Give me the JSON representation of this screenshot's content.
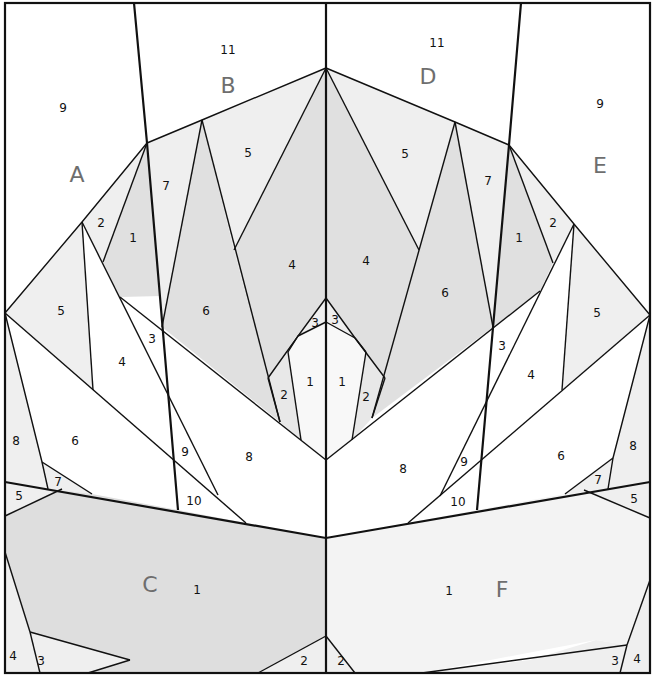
{
  "diagram": {
    "type": "paper-piecing quilt pattern",
    "colors": {
      "background": "#ffffff",
      "light_fill": "#efefef",
      "medium_fill": "#e0e0e0",
      "bottom_left_fill": "#dedede",
      "bottom_right_fill": "#f3f3f3",
      "line": "#111111",
      "section_letter": "#6e6e6e"
    },
    "sections": [
      {
        "letter": "A",
        "x": 77,
        "y": 174
      },
      {
        "letter": "B",
        "x": 228,
        "y": 85
      },
      {
        "letter": "C",
        "x": 150,
        "y": 584
      },
      {
        "letter": "D",
        "x": 428,
        "y": 76
      },
      {
        "letter": "E",
        "x": 600,
        "y": 165
      },
      {
        "letter": "F",
        "x": 502,
        "y": 589
      }
    ],
    "piece_numbers": [
      {
        "n": "9",
        "x": 63,
        "y": 108
      },
      {
        "n": "2",
        "x": 101,
        "y": 223
      },
      {
        "n": "1",
        "x": 133,
        "y": 238
      },
      {
        "n": "5",
        "x": 61,
        "y": 311
      },
      {
        "n": "4",
        "x": 122,
        "y": 362
      },
      {
        "n": "3",
        "x": 152,
        "y": 339
      },
      {
        "n": "8",
        "x": 16,
        "y": 441
      },
      {
        "n": "6",
        "x": 75,
        "y": 441
      },
      {
        "n": "7",
        "x": 58,
        "y": 482
      },
      {
        "n": "5",
        "x": 19,
        "y": 496
      },
      {
        "n": "11",
        "x": 228,
        "y": 50
      },
      {
        "n": "7",
        "x": 166,
        "y": 186
      },
      {
        "n": "5",
        "x": 248,
        "y": 153
      },
      {
        "n": "6",
        "x": 206,
        "y": 311
      },
      {
        "n": "4",
        "x": 292,
        "y": 265
      },
      {
        "n": "3",
        "x": 315,
        "y": 323
      },
      {
        "n": "2",
        "x": 284,
        "y": 395
      },
      {
        "n": "1",
        "x": 310,
        "y": 382
      },
      {
        "n": "9",
        "x": 185,
        "y": 452
      },
      {
        "n": "8",
        "x": 249,
        "y": 457
      },
      {
        "n": "10",
        "x": 194,
        "y": 501
      },
      {
        "n": "1",
        "x": 197,
        "y": 590
      },
      {
        "n": "4",
        "x": 13,
        "y": 656
      },
      {
        "n": "3",
        "x": 41,
        "y": 661
      },
      {
        "n": "2",
        "x": 304,
        "y": 661
      },
      {
        "n": "11",
        "x": 437,
        "y": 43
      },
      {
        "n": "5",
        "x": 405,
        "y": 154
      },
      {
        "n": "7",
        "x": 488,
        "y": 181
      },
      {
        "n": "4",
        "x": 366,
        "y": 261
      },
      {
        "n": "6",
        "x": 445,
        "y": 293
      },
      {
        "n": "3",
        "x": 335,
        "y": 320
      },
      {
        "n": "1",
        "x": 342,
        "y": 382
      },
      {
        "n": "2",
        "x": 366,
        "y": 397
      },
      {
        "n": "8",
        "x": 403,
        "y": 469
      },
      {
        "n": "9",
        "x": 464,
        "y": 462
      },
      {
        "n": "10",
        "x": 458,
        "y": 502
      },
      {
        "n": "9",
        "x": 600,
        "y": 104
      },
      {
        "n": "1",
        "x": 519,
        "y": 238
      },
      {
        "n": "2",
        "x": 553,
        "y": 223
      },
      {
        "n": "5",
        "x": 597,
        "y": 313
      },
      {
        "n": "3",
        "x": 502,
        "y": 346
      },
      {
        "n": "4",
        "x": 531,
        "y": 375
      },
      {
        "n": "6",
        "x": 561,
        "y": 456
      },
      {
        "n": "8",
        "x": 633,
        "y": 446
      },
      {
        "n": "7",
        "x": 598,
        "y": 480
      },
      {
        "n": "5",
        "x": 634,
        "y": 499
      },
      {
        "n": "1",
        "x": 449,
        "y": 591
      },
      {
        "n": "2",
        "x": 341,
        "y": 661
      },
      {
        "n": "3",
        "x": 615,
        "y": 661
      },
      {
        "n": "4",
        "x": 637,
        "y": 659
      }
    ]
  }
}
